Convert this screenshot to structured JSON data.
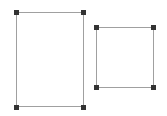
{
  "canvas": {
    "width": 167,
    "height": 116,
    "background": "#ffffff"
  },
  "colors": {
    "outline": "#a0a0a0",
    "handle": "#333333"
  },
  "shapes": [
    {
      "name": "left-rectangle",
      "x": 16,
      "y": 12,
      "w": 68,
      "h": 95
    },
    {
      "name": "right-rectangle",
      "x": 96,
      "y": 27,
      "w": 57,
      "h": 60
    }
  ]
}
